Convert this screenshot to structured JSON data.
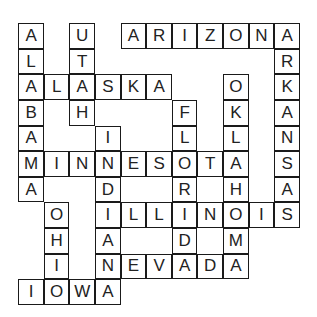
{
  "puzzle": {
    "type": "crossword-fill-in",
    "rows": 11,
    "cols": 11,
    "words": {
      "across": [
        "ARIZONA",
        "ALASKA",
        "MINNESOTA",
        "ILLINOIS",
        "NEVADA",
        "IOWA"
      ],
      "down": [
        "ALABAMA",
        "UTAH",
        "INDIANA",
        "FLORIDA",
        "OKLAHOMA",
        "ARKANSAS",
        "OHIO"
      ]
    },
    "cells": [
      {
        "r": 0,
        "c": 0,
        "ch": "A"
      },
      {
        "r": 0,
        "c": 2,
        "ch": "U"
      },
      {
        "r": 0,
        "c": 4,
        "ch": "A"
      },
      {
        "r": 0,
        "c": 5,
        "ch": "R"
      },
      {
        "r": 0,
        "c": 6,
        "ch": "I"
      },
      {
        "r": 0,
        "c": 7,
        "ch": "Z"
      },
      {
        "r": 0,
        "c": 8,
        "ch": "O"
      },
      {
        "r": 0,
        "c": 9,
        "ch": "N"
      },
      {
        "r": 0,
        "c": 10,
        "ch": "A"
      },
      {
        "r": 1,
        "c": 0,
        "ch": "L"
      },
      {
        "r": 1,
        "c": 2,
        "ch": "T"
      },
      {
        "r": 1,
        "c": 10,
        "ch": "R"
      },
      {
        "r": 2,
        "c": 0,
        "ch": "A"
      },
      {
        "r": 2,
        "c": 1,
        "ch": "L"
      },
      {
        "r": 2,
        "c": 2,
        "ch": "A"
      },
      {
        "r": 2,
        "c": 3,
        "ch": "S"
      },
      {
        "r": 2,
        "c": 4,
        "ch": "K"
      },
      {
        "r": 2,
        "c": 5,
        "ch": "A"
      },
      {
        "r": 2,
        "c": 8,
        "ch": "O"
      },
      {
        "r": 2,
        "c": 10,
        "ch": "K"
      },
      {
        "r": 3,
        "c": 0,
        "ch": "B"
      },
      {
        "r": 3,
        "c": 2,
        "ch": "H"
      },
      {
        "r": 3,
        "c": 6,
        "ch": "F"
      },
      {
        "r": 3,
        "c": 8,
        "ch": "K"
      },
      {
        "r": 3,
        "c": 10,
        "ch": "A"
      },
      {
        "r": 4,
        "c": 0,
        "ch": "A"
      },
      {
        "r": 4,
        "c": 3,
        "ch": "I"
      },
      {
        "r": 4,
        "c": 6,
        "ch": "L"
      },
      {
        "r": 4,
        "c": 8,
        "ch": "L"
      },
      {
        "r": 4,
        "c": 10,
        "ch": "N"
      },
      {
        "r": 5,
        "c": 0,
        "ch": "M"
      },
      {
        "r": 5,
        "c": 1,
        "ch": "I"
      },
      {
        "r": 5,
        "c": 2,
        "ch": "N"
      },
      {
        "r": 5,
        "c": 3,
        "ch": "N"
      },
      {
        "r": 5,
        "c": 4,
        "ch": "E"
      },
      {
        "r": 5,
        "c": 5,
        "ch": "S"
      },
      {
        "r": 5,
        "c": 6,
        "ch": "O"
      },
      {
        "r": 5,
        "c": 7,
        "ch": "T"
      },
      {
        "r": 5,
        "c": 8,
        "ch": "A"
      },
      {
        "r": 5,
        "c": 10,
        "ch": "S"
      },
      {
        "r": 6,
        "c": 0,
        "ch": "A"
      },
      {
        "r": 6,
        "c": 3,
        "ch": "D"
      },
      {
        "r": 6,
        "c": 6,
        "ch": "R"
      },
      {
        "r": 6,
        "c": 8,
        "ch": "H"
      },
      {
        "r": 6,
        "c": 10,
        "ch": "A"
      },
      {
        "r": 7,
        "c": 1,
        "ch": "O"
      },
      {
        "r": 7,
        "c": 3,
        "ch": "I"
      },
      {
        "r": 7,
        "c": 4,
        "ch": "L"
      },
      {
        "r": 7,
        "c": 5,
        "ch": "L"
      },
      {
        "r": 7,
        "c": 6,
        "ch": "I"
      },
      {
        "r": 7,
        "c": 7,
        "ch": "N"
      },
      {
        "r": 7,
        "c": 8,
        "ch": "O"
      },
      {
        "r": 7,
        "c": 9,
        "ch": "I"
      },
      {
        "r": 7,
        "c": 10,
        "ch": "S"
      },
      {
        "r": 8,
        "c": 1,
        "ch": "H"
      },
      {
        "r": 8,
        "c": 3,
        "ch": "A"
      },
      {
        "r": 8,
        "c": 6,
        "ch": "D"
      },
      {
        "r": 8,
        "c": 8,
        "ch": "M"
      },
      {
        "r": 9,
        "c": 1,
        "ch": "I"
      },
      {
        "r": 9,
        "c": 3,
        "ch": "N"
      },
      {
        "r": 9,
        "c": 4,
        "ch": "E"
      },
      {
        "r": 9,
        "c": 5,
        "ch": "V"
      },
      {
        "r": 9,
        "c": 6,
        "ch": "A"
      },
      {
        "r": 9,
        "c": 7,
        "ch": "D"
      },
      {
        "r": 9,
        "c": 8,
        "ch": "A"
      },
      {
        "r": 10,
        "c": 0,
        "ch": "I"
      },
      {
        "r": 10,
        "c": 1,
        "ch": "O"
      },
      {
        "r": 10,
        "c": 2,
        "ch": "W"
      },
      {
        "r": 10,
        "c": 3,
        "ch": "A"
      }
    ]
  }
}
